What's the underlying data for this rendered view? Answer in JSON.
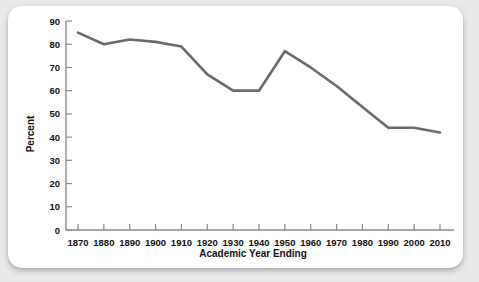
{
  "chart_data": {
    "type": "line",
    "title": "",
    "xlabel": "Academic Year Ending",
    "ylabel": "Percent",
    "x": [
      1870,
      1880,
      1890,
      1900,
      1910,
      1920,
      1930,
      1940,
      1950,
      1960,
      1970,
      1980,
      1990,
      2000,
      2010
    ],
    "values": [
      85,
      80,
      82,
      81,
      79,
      67,
      60,
      60,
      77,
      70,
      62,
      53,
      44,
      44,
      42
    ],
    "series": [
      {
        "name": "Percent",
        "values": [
          85,
          80,
          82,
          81,
          79,
          67,
          60,
          60,
          77,
          70,
          62,
          53,
          44,
          44,
          42
        ]
      }
    ],
    "xlim": [
      1870,
      2010
    ],
    "ylim": [
      0,
      90
    ],
    "y_ticks": [
      0,
      10,
      20,
      30,
      40,
      50,
      60,
      70,
      80,
      90
    ],
    "x_ticks": [
      1870,
      1880,
      1890,
      1900,
      1910,
      1920,
      1930,
      1940,
      1950,
      1960,
      1970,
      1980,
      1990,
      2000,
      2010
    ],
    "y_tick_labels": [
      "0",
      "10",
      "20",
      "30",
      "40",
      "50",
      "60",
      "70",
      "80",
      "90"
    ],
    "x_tick_labels": [
      "1870",
      "1880",
      "1890",
      "1900",
      "1910",
      "1920",
      "1930",
      "1940",
      "1950",
      "1960",
      "1970",
      "1980",
      "1990",
      "2000",
      "2010"
    ],
    "grid": false,
    "legend": false,
    "legend_position": "none",
    "line_color": "#6b6b6b",
    "axis_color": "#8a8a8a",
    "text_color": "#111111",
    "background_color": "#ffffff",
    "page_background_color": "#e9e9e9"
  }
}
